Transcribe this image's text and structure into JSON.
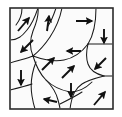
{
  "figure": {
    "background_color": "#ffffff",
    "panel_fill": "#fbfbfb",
    "border_color": "#2b2b2b",
    "wall_color": "#1a1a1a",
    "arrow_color": "#111111",
    "panel": {
      "x": 10,
      "y": 8,
      "width": 103,
      "height": 101,
      "border_width": 1.6
    }
  },
  "domain_walls": [
    {
      "name": "wall-1",
      "path": "M 10 40 C 18 40 22 36 27 30 C 32 24 36 14 38 8"
    },
    {
      "name": "wall-2",
      "path": "M 38 8 C 39 16 36 24 33 31 C 30 39 29 47 33 56"
    },
    {
      "name": "wall-3",
      "path": "M 10 63 C 18 60 26 59 33 56"
    },
    {
      "name": "wall-4",
      "path": "M 33 56 C 44 60 54 62 64 60 C 74 58 82 52 88 44"
    },
    {
      "name": "wall-5",
      "path": "M 62 8 C 60 18 56 28 50 37 C 44 46 38 52 33 56"
    },
    {
      "name": "wall-6",
      "path": "M 88 44 C 93 36 96 24 96 8"
    },
    {
      "name": "wall-7",
      "path": "M 88 44 C 96 44 104 44 113 44"
    },
    {
      "name": "wall-8",
      "path": "M 88 44 C 86 52 86 58 88 64 C 90 70 96 74 104 76"
    },
    {
      "name": "wall-9",
      "path": "M 104 76 C 108 76 110 76 113 76"
    },
    {
      "name": "wall-10",
      "path": "M 104 76 C 96 78 88 80 82 84 C 76 88 72 94 70 109"
    },
    {
      "name": "wall-11",
      "path": "M 33 56 C 36 66 40 74 46 80 C 52 86 60 90 70 92"
    },
    {
      "name": "wall-12",
      "path": "M 70 92 C 78 92 86 88 92 82"
    },
    {
      "name": "wall-13",
      "path": "M 36 62 C 32 72 30 84 32 96 C 33 102 34 106 35 109"
    },
    {
      "name": "wall-14",
      "path": "M 10 90 C 18 88 26 86 32 84"
    },
    {
      "name": "wall-15",
      "path": "M 46 80 C 52 86 56 92 58 100 C 59 104 60 107 60 109"
    },
    {
      "name": "wall-16",
      "path": "M 60 104 C 68 100 76 96 82 92"
    },
    {
      "name": "wall-17",
      "path": "M 56 8 C 54 14 52 20 48 26"
    },
    {
      "name": "wall-18",
      "path": "M 22 8 C 22 14 20 20 16 25"
    }
  ],
  "arrows": [
    {
      "name": "arrow-up-right-1",
      "x1": 18,
      "y1": 31,
      "x2": 29,
      "y2": 18,
      "direction": "up-right"
    },
    {
      "name": "arrow-up-2",
      "x1": 47,
      "y1": 31,
      "x2": 49,
      "y2": 16,
      "direction": "up"
    },
    {
      "name": "arrow-right-3",
      "x1": 76,
      "y1": 21,
      "x2": 92,
      "y2": 21,
      "direction": "right"
    },
    {
      "name": "arrow-down-left-4",
      "x1": 33,
      "y1": 40,
      "x2": 21,
      "y2": 52,
      "direction": "down-left"
    },
    {
      "name": "arrow-down-5",
      "x1": 104,
      "y1": 29,
      "x2": 104,
      "y2": 43,
      "direction": "down"
    },
    {
      "name": "arrow-left-6",
      "x1": 81,
      "y1": 51,
      "x2": 67,
      "y2": 51,
      "direction": "left"
    },
    {
      "name": "arrow-up-right-7",
      "x1": 42,
      "y1": 70,
      "x2": 54,
      "y2": 58,
      "direction": "up-right"
    },
    {
      "name": "arrow-up-right-8",
      "x1": 62,
      "y1": 78,
      "x2": 74,
      "y2": 66,
      "direction": "up-right"
    },
    {
      "name": "arrow-down-left-9",
      "x1": 106,
      "y1": 58,
      "x2": 95,
      "y2": 69,
      "direction": "down-left"
    },
    {
      "name": "arrow-down-10",
      "x1": 21,
      "y1": 70,
      "x2": 21,
      "y2": 85,
      "direction": "down"
    },
    {
      "name": "arrow-down-11",
      "x1": 71,
      "y1": 83,
      "x2": 71,
      "y2": 97,
      "direction": "down"
    },
    {
      "name": "arrow-up-right-12",
      "x1": 94,
      "y1": 105,
      "x2": 105,
      "y2": 92,
      "direction": "up-right"
    },
    {
      "name": "arrow-left-13",
      "x1": 57,
      "y1": 102,
      "x2": 44,
      "y2": 99,
      "direction": "left"
    }
  ]
}
